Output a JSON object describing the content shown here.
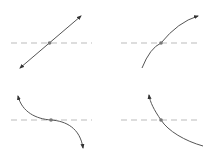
{
  "figure": {
    "colors": {
      "curve": "#555555",
      "dashed_line": "#bbbbbb",
      "point": "#777777",
      "background": "#ffffff"
    },
    "panels": [
      {
        "id": "top-left",
        "shape": "straight line, positive slope",
        "arrows": "both ends"
      },
      {
        "id": "top-right",
        "shape": "concave-down increasing curve",
        "arrows": "upper end"
      },
      {
        "id": "bottom-left",
        "shape": "decreasing S-curve with inflection at crossing",
        "arrows": "both ends"
      },
      {
        "id": "bottom-right",
        "shape": "concave-up decreasing curve",
        "arrows": "upper end"
      }
    ]
  }
}
